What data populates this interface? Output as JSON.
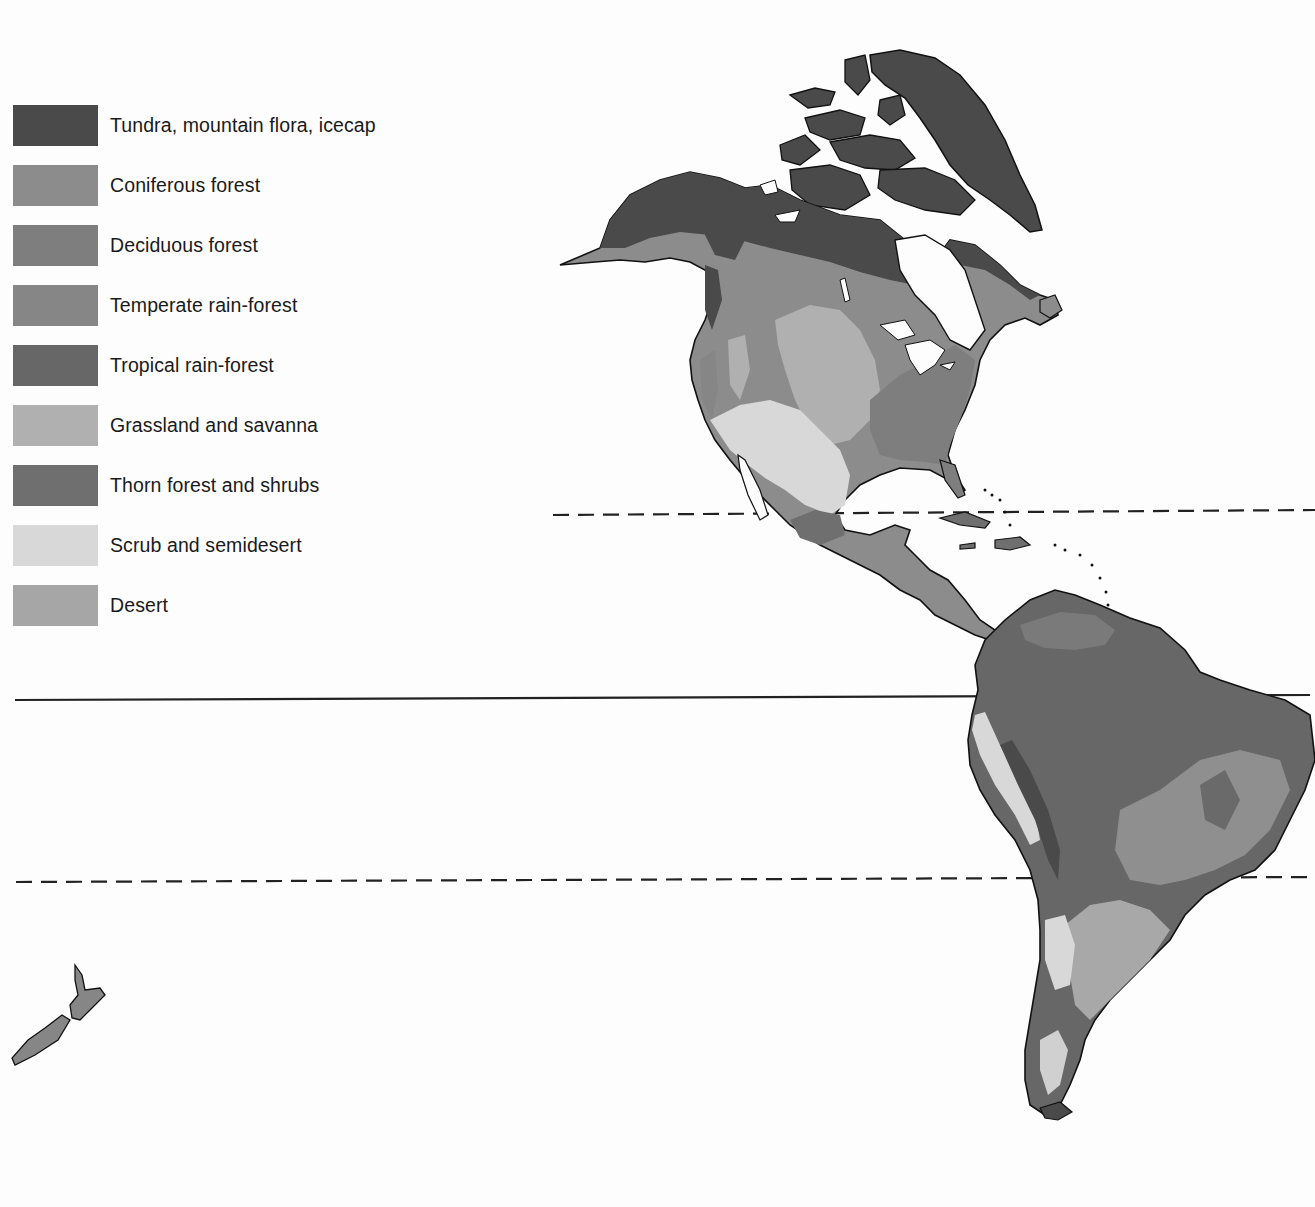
{
  "legend": {
    "items": [
      {
        "label": "Tundra, mountain flora, icecap",
        "color": "#4a4a4a"
      },
      {
        "label": "Coniferous forest",
        "color": "#8c8c8c"
      },
      {
        "label": "Deciduous forest",
        "color": "#7e7e7e"
      },
      {
        "label": "Temperate rain-forest",
        "color": "#868686"
      },
      {
        "label": "Tropical rain-forest",
        "color": "#676767"
      },
      {
        "label": "Grassland and savanna",
        "color": "#b0b0b0"
      },
      {
        "label": "Thorn forest and shrubs",
        "color": "#6f6f6f"
      },
      {
        "label": "Scrub and semidesert",
        "color": "#d8d8d8"
      },
      {
        "label": "Desert",
        "color": "#a6a6a6"
      }
    ]
  },
  "map": {
    "regions": [
      "North America",
      "Central America",
      "Caribbean",
      "South America",
      "Greenland",
      "New Zealand"
    ],
    "lines": [
      {
        "name": "Tropic of Cancer",
        "style": "dashed"
      },
      {
        "name": "Equator",
        "style": "solid"
      },
      {
        "name": "Tropic of Capricorn",
        "style": "dashed"
      }
    ]
  },
  "colors": {
    "background": "#fdfdfd",
    "outline": "#1a1a1a",
    "water": "#ffffff"
  }
}
